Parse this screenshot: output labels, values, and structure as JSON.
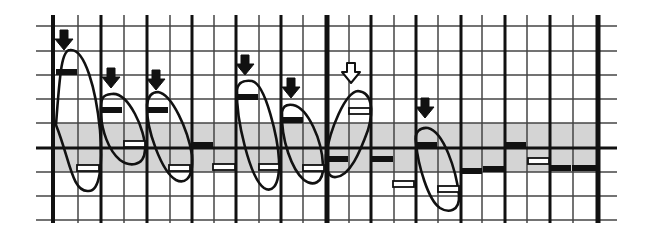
{
  "diagram": {
    "colors": {
      "ink": "#111111",
      "band": "#d4d4d4",
      "grid_thin": "#444444",
      "background": "#ffffff"
    },
    "grid": {
      "x_left": 36,
      "x_right": 617,
      "y_top": 15,
      "y_bottom": 223,
      "h_lines": [
        26,
        51,
        75,
        99,
        123,
        172,
        196,
        220
      ],
      "baseline_y": 148,
      "v_lines": [
        {
          "x": 53,
          "w": 4
        },
        {
          "x": 78,
          "w": 1.5
        },
        {
          "x": 101,
          "w": 3
        },
        {
          "x": 124,
          "w": 1.5
        },
        {
          "x": 147,
          "w": 3
        },
        {
          "x": 170,
          "w": 1.5
        },
        {
          "x": 192,
          "w": 3
        },
        {
          "x": 214,
          "w": 1.5
        },
        {
          "x": 236,
          "w": 3
        },
        {
          "x": 259,
          "w": 1.5
        },
        {
          "x": 281,
          "w": 3
        },
        {
          "x": 303,
          "w": 1.5
        },
        {
          "x": 327,
          "w": 5
        },
        {
          "x": 349,
          "w": 1.5
        },
        {
          "x": 371,
          "w": 3
        },
        {
          "x": 394,
          "w": 1.5
        },
        {
          "x": 416,
          "w": 3
        },
        {
          "x": 438,
          "w": 1.5
        },
        {
          "x": 461,
          "w": 3
        },
        {
          "x": 482,
          "w": 1.5
        },
        {
          "x": 505,
          "w": 3
        },
        {
          "x": 527,
          "w": 1.5
        },
        {
          "x": 550,
          "w": 3
        },
        {
          "x": 573,
          "w": 1.5
        },
        {
          "x": 598,
          "w": 5
        }
      ],
      "band": {
        "x1": 53,
        "x2": 598,
        "y1": 123,
        "y2": 172
      }
    },
    "filled_bars": [
      {
        "x1": 56,
        "x2": 77,
        "y": 72
      },
      {
        "x1": 101,
        "x2": 122,
        "y": 110
      },
      {
        "x1": 147,
        "x2": 168,
        "y": 110
      },
      {
        "x1": 192,
        "x2": 213,
        "y": 145
      },
      {
        "x1": 237,
        "x2": 258,
        "y": 97
      },
      {
        "x1": 282,
        "x2": 303,
        "y": 120
      },
      {
        "x1": 327,
        "x2": 348,
        "y": 159
      },
      {
        "x1": 372,
        "x2": 393,
        "y": 159
      },
      {
        "x1": 416,
        "x2": 437,
        "y": 145
      },
      {
        "x1": 461,
        "x2": 482,
        "y": 171
      },
      {
        "x1": 505,
        "x2": 526,
        "y": 145
      },
      {
        "x1": 550,
        "x2": 571,
        "y": 168
      },
      {
        "x1": 572,
        "x2": 596,
        "y": 168
      },
      {
        "x1": 483,
        "x2": 505,
        "y": 169
      }
    ],
    "hollow_bars": [
      {
        "x1": 77,
        "x2": 99,
        "y": 168
      },
      {
        "x1": 124,
        "x2": 145,
        "y": 144
      },
      {
        "x1": 169,
        "x2": 190,
        "y": 168
      },
      {
        "x1": 213,
        "x2": 235,
        "y": 167
      },
      {
        "x1": 259,
        "x2": 279,
        "y": 167
      },
      {
        "x1": 303,
        "x2": 324,
        "y": 168
      },
      {
        "x1": 349,
        "x2": 370,
        "y": 111
      },
      {
        "x1": 393,
        "x2": 414,
        "y": 184
      },
      {
        "x1": 438,
        "x2": 459,
        "y": 189
      },
      {
        "x1": 528,
        "x2": 549,
        "y": 161
      }
    ],
    "loops": [
      {
        "name": "loop-1",
        "d": "M56 125 C60 70, 62 50, 70 50 C85 48, 96 90, 100 130 C103 165, 100 192, 88 191 C72 192, 70 160, 56 125 Z"
      },
      {
        "name": "loop-2",
        "d": "M101 115 C100 95, 104 95, 112 94 C128 92, 146 130, 145 150 C144 168, 128 166, 120 160 C108 150, 102 130, 101 115 Z"
      },
      {
        "name": "loop-3",
        "d": "M147 105 C148 96, 152 92, 158 92 C172 94, 188 130, 192 155 C194 183, 182 183, 176 180 C162 172, 146 130, 147 105 Z"
      },
      {
        "name": "loop-4",
        "d": "M237 90 C238 82, 244 80, 252 81 C266 84, 278 140, 279 160 C280 190, 270 192, 264 188 C250 178, 236 120, 237 90 Z"
      },
      {
        "name": "loop-5",
        "d": "M282 112 C283 106, 287 104, 293 105 C308 108, 322 140, 323 165 C324 185, 312 186, 304 180 C292 170, 281 140, 282 112 Z"
      },
      {
        "name": "loop-6",
        "d": "M326 155 C330 130, 345 92, 358 91 C372 92, 374 110, 368 130 C360 152, 350 176, 336 177 C328 178, 325 168, 326 155 Z"
      },
      {
        "name": "loop-7",
        "d": "M416 143 C414 132, 420 127, 428 128 C444 132, 456 170, 459 195 C460 212, 448 213, 440 208 C428 200, 418 165, 416 143 Z"
      }
    ],
    "arrows": [
      {
        "x": 64,
        "y": 30,
        "filled": true
      },
      {
        "x": 111,
        "y": 68,
        "filled": true
      },
      {
        "x": 156,
        "y": 70,
        "filled": true
      },
      {
        "x": 245,
        "y": 55,
        "filled": true
      },
      {
        "x": 291,
        "y": 78,
        "filled": true
      },
      {
        "x": 351,
        "y": 63,
        "filled": false
      },
      {
        "x": 425,
        "y": 98,
        "filled": true
      }
    ]
  }
}
